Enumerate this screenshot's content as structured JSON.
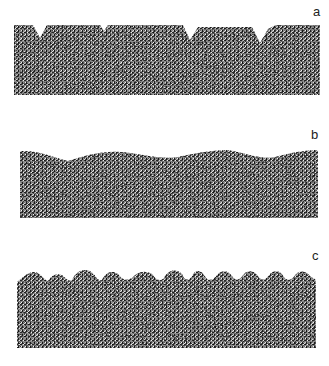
{
  "figure": {
    "panels": [
      {
        "label": "a",
        "description": "stippled slab with trapezoidal ridges separated by V-shaped notches"
      },
      {
        "label": "b",
        "description": "stippled slab with low, gently undulating wavy top surface"
      },
      {
        "label": "c",
        "description": "stippled slab with many rounded peaks along the top surface"
      }
    ]
  },
  "colors": {
    "background": "#ffffff",
    "stipple": "#1a1a1a",
    "fill": "#9a9a9a"
  }
}
